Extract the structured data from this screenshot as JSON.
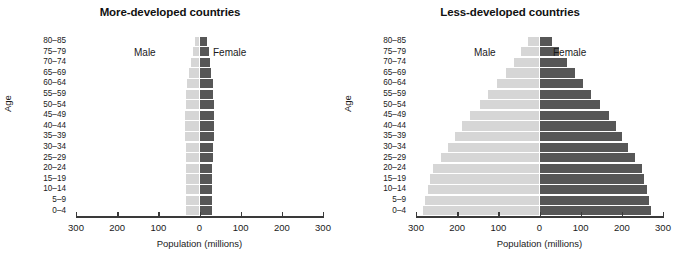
{
  "chart_data": [
    {
      "type": "bar",
      "subtype": "population-pyramid",
      "title": "More-developed countries",
      "xlabel": "Population (millions)",
      "ylabel": "Age",
      "xlim": [
        -300,
        300
      ],
      "xticks": [
        -300,
        -200,
        -100,
        0,
        100,
        200,
        300
      ],
      "xticklabels": [
        "300",
        "200",
        "100",
        "0",
        "100",
        "200",
        "300"
      ],
      "grid": false,
      "legend_position": "inside-top",
      "categories": [
        "80–85",
        "75–79",
        "70–74",
        "65–69",
        "60–64",
        "55–59",
        "50–54",
        "45–49",
        "40–44",
        "35–39",
        "30–34",
        "25–29",
        "20–24",
        "15–19",
        "10–14",
        "5–9",
        "0–4"
      ],
      "series": [
        {
          "name": "Male",
          "side": "left",
          "color": "#d6d6d6",
          "values": [
            11,
            16,
            21,
            25,
            30,
            33,
            34,
            36,
            36,
            35,
            34,
            33,
            32,
            32,
            33,
            32,
            32
          ]
        },
        {
          "name": "Female",
          "side": "right",
          "color": "#575757",
          "values": [
            18,
            22,
            25,
            28,
            32,
            34,
            35,
            36,
            36,
            35,
            34,
            32,
            31,
            31,
            31,
            31,
            30
          ]
        }
      ]
    },
    {
      "type": "bar",
      "subtype": "population-pyramid",
      "title": "Less-developed countries",
      "xlabel": "Population (millions)",
      "ylabel": "Age",
      "xlim": [
        -300,
        300
      ],
      "xticks": [
        -300,
        -200,
        -100,
        0,
        100,
        200,
        300
      ],
      "xticklabels": [
        "300",
        "200",
        "100",
        "0",
        "100",
        "200",
        "300"
      ],
      "grid": false,
      "legend_position": "inside-top",
      "categories": [
        "80–85",
        "75–79",
        "70–74",
        "65–69",
        "60–64",
        "55–59",
        "50–54",
        "45–49",
        "40–44",
        "35–39",
        "30–34",
        "25–29",
        "20–24",
        "15–19",
        "10–14",
        "5–9",
        "0–4"
      ],
      "series": [
        {
          "name": "Male",
          "side": "left",
          "color": "#d6d6d6",
          "values": [
            28,
            45,
            62,
            82,
            103,
            124,
            145,
            168,
            188,
            205,
            222,
            240,
            258,
            266,
            272,
            277,
            283
          ]
        },
        {
          "name": "Female",
          "side": "right",
          "color": "#575757",
          "values": [
            30,
            48,
            66,
            86,
            106,
            126,
            147,
            168,
            186,
            201,
            216,
            232,
            248,
            255,
            261,
            266,
            271
          ]
        }
      ]
    }
  ],
  "panels": [
    {
      "title": "More-developed countries",
      "y_axis_title": "Age",
      "x_axis_title": "Population (millions)",
      "male_label": "Male",
      "female_label": "Female"
    },
    {
      "title": "Less-developed countries",
      "y_axis_title": "Age",
      "x_axis_title": "Population (millions)",
      "male_label": "Male",
      "female_label": "Female"
    }
  ],
  "colors": {
    "male_bar": "#d6d6d6",
    "female_bar": "#575757",
    "axis": "#3a3a3a",
    "text": "#1a1a1a",
    "background": "#ffffff"
  }
}
